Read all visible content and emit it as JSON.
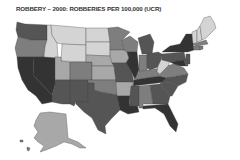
{
  "title": "ROBBERY – 2000: ROBBERIES PER 100,000 (UCR)",
  "palette": {
    "level1": "#d4d4d4",
    "level2": "#a8a8a8",
    "level3": "#7e7e7e",
    "level4": "#555555",
    "level5": "#333333"
  },
  "states": [
    {
      "name": "Washington",
      "level": 4
    },
    {
      "name": "Oregon",
      "level": 3
    },
    {
      "name": "California",
      "level": 5
    },
    {
      "name": "Nevada",
      "level": 5
    },
    {
      "name": "Idaho",
      "level": 1
    },
    {
      "name": "Montana",
      "level": 1
    },
    {
      "name": "Wyoming",
      "level": 1
    },
    {
      "name": "Utah",
      "level": 2
    },
    {
      "name": "Arizona",
      "level": 4
    },
    {
      "name": "Colorado",
      "level": 3
    },
    {
      "name": "New Mexico",
      "level": 4
    },
    {
      "name": "North Dakota",
      "level": 1
    },
    {
      "name": "South Dakota",
      "level": 1
    },
    {
      "name": "Nebraska",
      "level": 2
    },
    {
      "name": "Kansas",
      "level": 2
    },
    {
      "name": "Oklahoma",
      "level": 3
    },
    {
      "name": "Texas",
      "level": 4
    },
    {
      "name": "Minnesota",
      "level": 3
    },
    {
      "name": "Iowa",
      "level": 2
    },
    {
      "name": "Missouri",
      "level": 4
    },
    {
      "name": "Arkansas",
      "level": 2
    },
    {
      "name": "Louisiana",
      "level": 5
    },
    {
      "name": "Wisconsin",
      "level": 3
    },
    {
      "name": "Illinois",
      "level": 5
    },
    {
      "name": "Michigan",
      "level": 4
    },
    {
      "name": "Indiana",
      "level": 3
    },
    {
      "name": "Ohio",
      "level": 4
    },
    {
      "name": "Kentucky",
      "level": 3
    },
    {
      "name": "Tennessee",
      "level": 5
    },
    {
      "name": "Mississippi",
      "level": 4
    },
    {
      "name": "Alabama",
      "level": 3
    },
    {
      "name": "Georgia",
      "level": 4
    },
    {
      "name": "Florida",
      "level": 5
    },
    {
      "name": "South Carolina",
      "level": 4
    },
    {
      "name": "North Carolina",
      "level": 4
    },
    {
      "name": "Virginia",
      "level": 3
    },
    {
      "name": "West Virginia",
      "level": 1
    },
    {
      "name": "Pennsylvania",
      "level": 4
    },
    {
      "name": "New York",
      "level": 5
    },
    {
      "name": "New Jersey",
      "level": 4
    },
    {
      "name": "Maryland",
      "level": 5
    },
    {
      "name": "Delaware",
      "level": 4
    },
    {
      "name": "Vermont",
      "level": 1
    },
    {
      "name": "New Hampshire",
      "level": 1
    },
    {
      "name": "Maine",
      "level": 1
    },
    {
      "name": "Massachusetts",
      "level": 3
    },
    {
      "name": "Connecticut",
      "level": 3
    },
    {
      "name": "Rhode Island",
      "level": 3
    },
    {
      "name": "Alaska",
      "level": 2
    },
    {
      "name": "Hawaii",
      "level": 3
    }
  ]
}
